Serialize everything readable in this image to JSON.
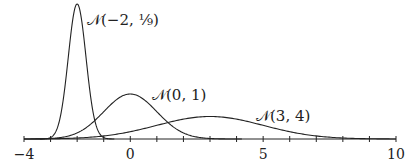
{
  "chart_data": {
    "type": "line",
    "title": "",
    "xlabel": "",
    "ylabel": "",
    "xlim": [
      -4,
      10
    ],
    "x_ticks": [
      -4,
      -3,
      -2,
      -1,
      0,
      1,
      2,
      3,
      4,
      5,
      6,
      7,
      8,
      9,
      10
    ],
    "x_tick_labels": [
      {
        "value": -4,
        "label": "−4"
      },
      {
        "value": 0,
        "label": "0"
      },
      {
        "value": 5,
        "label": "5"
      },
      {
        "value": 10,
        "label": "10"
      }
    ],
    "grid": false,
    "legend": "none (inline annotations)",
    "series": [
      {
        "name": "N(-2, 1/9)",
        "label": "𝒩(−2, ⅑)",
        "mean": -2,
        "variance": 0.1111,
        "label_pos": [
          87,
          25
        ]
      },
      {
        "name": "N(0, 1)",
        "label": "𝒩(0, 1)",
        "mean": 0,
        "variance": 1,
        "label_pos": [
          152,
          100
        ]
      },
      {
        "name": "N(3, 4)",
        "label": "𝒩(3, 4)",
        "mean": 3,
        "variance": 4,
        "label_pos": [
          256,
          121
        ]
      }
    ]
  }
}
